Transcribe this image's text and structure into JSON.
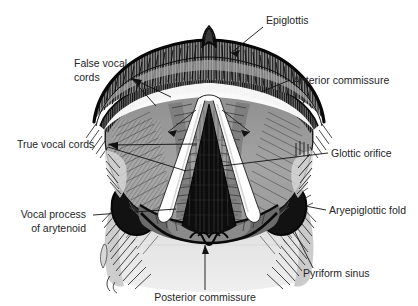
{
  "figure": {
    "background_color": "#ffffff",
    "text_color": "#262626",
    "leader_color": "#111111",
    "palette": {
      "ink_black": "#111111",
      "outline_black": "#0d0d0d",
      "mid_gray": "#9a9a9a",
      "light_gray": "#d2d2d2",
      "pale_gray": "#e8e8e8",
      "dark_gray": "#4a4a4a",
      "white": "#ffffff"
    }
  },
  "labels": [
    {
      "id": "epiglottis",
      "text": "Epiglottis",
      "align": "start",
      "x": 266,
      "y": 24
    },
    {
      "id": "false-vocal-cords",
      "text": "False vocal",
      "text2": "cords",
      "align": "start",
      "x": 74,
      "y": 67,
      "y2": 81
    },
    {
      "id": "anterior-commissure",
      "text": "Anterior commissure",
      "align": "start",
      "x": 293,
      "y": 84
    },
    {
      "id": "true-vocal-cords",
      "text": "True vocal cords",
      "align": "start",
      "x": 17,
      "y": 148
    },
    {
      "id": "glottic-orifice",
      "text": "Glottic orifice",
      "align": "start",
      "x": 331,
      "y": 157
    },
    {
      "id": "vocal-process-of-arytenoid",
      "text": "Vocal process",
      "text2": "of arytenoid",
      "align": "end",
      "x": 86,
      "y": 218,
      "y2": 232
    },
    {
      "id": "aryepiglottic-fold",
      "text": "Aryepiglottic fold",
      "align": "start",
      "x": 329,
      "y": 214
    },
    {
      "id": "pyriform-sinus",
      "text": "Pyriform sinus",
      "align": "start",
      "x": 303,
      "y": 277
    },
    {
      "id": "posterior-commissure",
      "text": "Posterior commissure",
      "align": "middle",
      "x": 205,
      "y": 301
    }
  ],
  "structures": [
    {
      "id": "epiglottis-body",
      "name": "epiglottis"
    },
    {
      "id": "epiglottis-tubercle",
      "name": "epiglottic tubercle"
    },
    {
      "id": "false-cord-left",
      "name": "left false vocal cord"
    },
    {
      "id": "false-cord-right",
      "name": "right false vocal cord"
    },
    {
      "id": "true-cord-left",
      "name": "left true vocal cord"
    },
    {
      "id": "true-cord-right",
      "name": "right true vocal cord"
    },
    {
      "id": "glottis",
      "name": "glottic orifice"
    },
    {
      "id": "anterior-commissure-point",
      "name": "anterior commissure"
    },
    {
      "id": "posterior-commissure-point",
      "name": "posterior commissure"
    },
    {
      "id": "pyriform-sinus-left",
      "name": "left pyriform sinus"
    },
    {
      "id": "pyriform-sinus-right",
      "name": "right pyriform sinus"
    },
    {
      "id": "aryepiglottic-fold-left",
      "name": "left aryepiglottic fold"
    },
    {
      "id": "aryepiglottic-fold-right",
      "name": "right aryepiglottic fold"
    },
    {
      "id": "arytenoid-region",
      "name": "arytenoid / vocal process"
    },
    {
      "id": "postcricoid-region",
      "name": "postcricoid region"
    }
  ]
}
